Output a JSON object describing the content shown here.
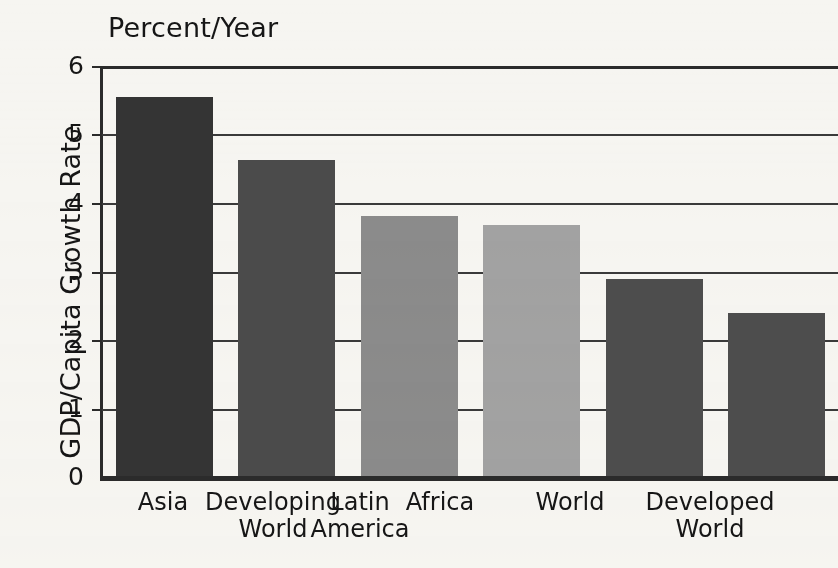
{
  "chart_data": {
    "type": "bar",
    "title": "Percent/Year",
    "xlabel": "",
    "ylabel": "GDP/Capita Growth Rate",
    "ylim": [
      0,
      6
    ],
    "yticks": [
      "0",
      "1",
      "2",
      "3",
      "4",
      "5",
      "6"
    ],
    "grid": true,
    "legend": "none",
    "categories": [
      "Asia",
      "Developing World",
      "Latin America",
      "Africa",
      "World",
      "Developed World"
    ],
    "category_lines": [
      [
        "Asia",
        ""
      ],
      [
        "Developing",
        "World"
      ],
      [
        "Latin",
        "America"
      ],
      [
        "Africa",
        ""
      ],
      [
        "World",
        ""
      ],
      [
        "Developed",
        "World"
      ]
    ],
    "values": [
      5.55,
      4.62,
      3.8,
      3.68,
      2.88,
      2.39
    ],
    "bar_colors": [
      "#343434",
      "#4b4b4b",
      "#8b8b8b",
      "#a2a2a2",
      "#4d4d4d",
      "#4d4d4d"
    ]
  },
  "axis": {
    "tick_0": "0",
    "tick_1": "1",
    "tick_2": "2",
    "tick_3": "3",
    "tick_4": "4",
    "tick_5": "5",
    "tick_6": "6"
  },
  "labels": {
    "cat_0_l1": "Asia",
    "cat_0_l2": "",
    "cat_1_l1": "Developing",
    "cat_1_l2": "World",
    "cat_2_l1": "Latin",
    "cat_2_l2": "America",
    "cat_3_l1": "Africa",
    "cat_3_l2": "",
    "cat_4_l1": "World",
    "cat_4_l2": "",
    "cat_5_l1": "Developed",
    "cat_5_l2": "World"
  },
  "colors": {
    "background": "#f6f5f1",
    "axis": "#2b2b2b",
    "gridline": "#3a3a3a",
    "text": "#161616"
  }
}
